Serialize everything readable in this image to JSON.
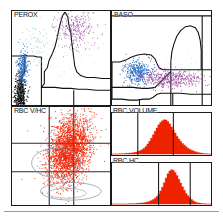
{
  "report": {
    "kind": "hematology-analyzer-cytogram-report",
    "panels": [
      "PEROX",
      "BASO",
      "RBC V/HC",
      "RBC VOLUME",
      "RBC HC"
    ]
  },
  "panels": {
    "perox": {
      "label": "PEROX",
      "type": "scatter",
      "xlabel": "",
      "ylabel": "",
      "populations": [
        {
          "name": "noise-debris",
          "color": "#111111",
          "n": 420
        },
        {
          "name": "lymphocytes",
          "color": "#2a6fc4",
          "n": 260
        },
        {
          "name": "mononuclear",
          "color": "#7fbf9f",
          "n": 70
        },
        {
          "name": "neutrophils-eosinophils",
          "color": "#8e3f96",
          "n": 300
        }
      ],
      "gate_color": "#101010"
    },
    "baso": {
      "label": "BASO",
      "type": "scatter",
      "populations": [
        {
          "name": "mononuclear",
          "color": "#2a6fc4",
          "n": 330
        },
        {
          "name": "polymorphonuclear",
          "color": "#8e3f96",
          "n": 420
        }
      ],
      "gate_color": "#101010"
    },
    "rbc_vhc": {
      "label": "RBC V/HC",
      "type": "scatter",
      "grid": {
        "vertical": 2,
        "horizontal": 2
      },
      "populations": [
        {
          "name": "red-blood-cells",
          "color": "#ef2200",
          "n": 2600
        }
      ],
      "contour_color": "#8c96a8"
    },
    "rbc_volume": {
      "label": "RBC VOLUME",
      "type": "histogram",
      "fill_color": "#ef2200",
      "markers": [
        0.26,
        0.62
      ],
      "bins": [
        0.0,
        0.0,
        0.0,
        0.0,
        0.01,
        0.01,
        0.01,
        0.02,
        0.02,
        0.03,
        0.03,
        0.04,
        0.05,
        0.06,
        0.08,
        0.1,
        0.13,
        0.17,
        0.22,
        0.29,
        0.37,
        0.46,
        0.56,
        0.66,
        0.76,
        0.85,
        0.92,
        0.97,
        1.0,
        0.99,
        0.95,
        0.88,
        0.79,
        0.7,
        0.61,
        0.52,
        0.44,
        0.37,
        0.31,
        0.26,
        0.21,
        0.17,
        0.14,
        0.11,
        0.09,
        0.07,
        0.05,
        0.04,
        0.03,
        0.02,
        0.01,
        0.01,
        0.0,
        0.0
      ]
    },
    "rbc_hc": {
      "label": "RBC HC",
      "type": "histogram",
      "fill_color": "#ef2200",
      "markers": [
        0.47,
        0.79
      ],
      "bins": [
        0.0,
        0.0,
        0.0,
        0.0,
        0.0,
        0.0,
        0.0,
        0.0,
        0.0,
        0.01,
        0.01,
        0.01,
        0.01,
        0.02,
        0.02,
        0.03,
        0.03,
        0.04,
        0.05,
        0.06,
        0.08,
        0.1,
        0.13,
        0.17,
        0.22,
        0.29,
        0.38,
        0.49,
        0.62,
        0.76,
        0.88,
        0.96,
        1.0,
        0.98,
        0.92,
        0.83,
        0.72,
        0.61,
        0.5,
        0.4,
        0.31,
        0.24,
        0.18,
        0.13,
        0.09,
        0.06,
        0.04,
        0.03,
        0.02,
        0.01,
        0.01,
        0.0,
        0.0,
        0.0
      ]
    }
  },
  "chart_data": [
    {
      "type": "scatter",
      "title": "PEROX",
      "xlabel": "Peroxidase Absorbance",
      "ylabel": "Light Scatter (Volume)",
      "series": [
        {
          "name": "Noise / Debris",
          "color": "#111111",
          "centroid": [
            0.07,
            0.1
          ],
          "spread": [
            0.035,
            0.11
          ],
          "n": 420
        },
        {
          "name": "Lymphocytes",
          "color": "#2a6fc4",
          "centroid": [
            0.1,
            0.4
          ],
          "spread": [
            0.03,
            0.085
          ],
          "n": 260
        },
        {
          "name": "LUC / Mono",
          "color": "#7fbf9f",
          "centroid": [
            0.25,
            0.62
          ],
          "spread": [
            0.075,
            0.13
          ],
          "n": 70
        },
        {
          "name": "Neutrophils / Eosinophils",
          "color": "#8e3f96",
          "centroid": [
            0.63,
            0.8
          ],
          "spread": [
            0.11,
            0.1
          ],
          "n": 300
        }
      ],
      "xlim": [
        0,
        1
      ],
      "ylim": [
        0,
        1
      ],
      "grid": false,
      "legend": "none"
    },
    {
      "type": "scatter",
      "title": "BASO",
      "xlabel": "Light Scatter (Low Angle)",
      "ylabel": "Light Scatter (High Angle)",
      "series": [
        {
          "name": "Mononuclear",
          "color": "#2a6fc4",
          "centroid": [
            0.26,
            0.35
          ],
          "spread": [
            0.075,
            0.07
          ],
          "n": 330
        },
        {
          "name": "Polymorphonuclear",
          "color": "#8e3f96",
          "centroid": [
            0.58,
            0.28
          ],
          "spread": [
            0.17,
            0.055
          ],
          "n": 420
        }
      ],
      "xlim": [
        0,
        1
      ],
      "ylim": [
        0,
        1
      ],
      "grid": false,
      "legend": "none"
    },
    {
      "type": "scatter",
      "title": "RBC V/HC",
      "xlabel": "Hemoglobin Concentration (HC)",
      "ylabel": "Volume (V)",
      "series": [
        {
          "name": "RBC",
          "color": "#ef2200",
          "centroid": [
            0.58,
            0.58
          ],
          "spread": [
            0.13,
            0.19
          ],
          "n": 2600
        }
      ],
      "xlim": [
        0,
        1
      ],
      "ylim": [
        0,
        1
      ],
      "grid": true,
      "legend": "none"
    },
    {
      "type": "area",
      "title": "RBC VOLUME",
      "xlabel": "Volume (fL)",
      "ylabel": "Relative Frequency",
      "x": [
        0,
        1,
        2,
        3,
        4,
        5,
        6,
        7,
        8,
        9,
        10,
        11,
        12,
        13,
        14,
        15,
        16,
        17,
        18,
        19,
        20,
        21,
        22,
        23,
        24,
        25,
        26,
        27,
        28,
        29,
        30,
        31,
        32,
        33,
        34,
        35,
        36,
        37,
        38,
        39,
        40,
        41,
        42,
        43,
        44,
        45,
        46,
        47,
        48,
        49,
        50,
        51,
        52,
        53
      ],
      "values": [
        0.0,
        0.0,
        0.0,
        0.0,
        0.01,
        0.01,
        0.01,
        0.02,
        0.02,
        0.03,
        0.03,
        0.04,
        0.05,
        0.06,
        0.08,
        0.1,
        0.13,
        0.17,
        0.22,
        0.29,
        0.37,
        0.46,
        0.56,
        0.66,
        0.76,
        0.85,
        0.92,
        0.97,
        1.0,
        0.99,
        0.95,
        0.88,
        0.79,
        0.7,
        0.61,
        0.52,
        0.44,
        0.37,
        0.31,
        0.26,
        0.21,
        0.17,
        0.14,
        0.11,
        0.09,
        0.07,
        0.05,
        0.04,
        0.03,
        0.02,
        0.01,
        0.01,
        0.0,
        0.0
      ],
      "markers": [
        0.26,
        0.62
      ],
      "ylim": [
        0,
        1
      ],
      "grid": false,
      "legend": "none"
    },
    {
      "type": "area",
      "title": "RBC HC",
      "xlabel": "Hemoglobin Concentration (g/dL)",
      "ylabel": "Relative Frequency",
      "x": [
        0,
        1,
        2,
        3,
        4,
        5,
        6,
        7,
        8,
        9,
        10,
        11,
        12,
        13,
        14,
        15,
        16,
        17,
        18,
        19,
        20,
        21,
        22,
        23,
        24,
        25,
        26,
        27,
        28,
        29,
        30,
        31,
        32,
        33,
        34,
        35,
        36,
        37,
        38,
        39,
        40,
        41,
        42,
        43,
        44,
        45,
        46,
        47,
        48,
        49,
        50,
        51,
        52,
        53
      ],
      "values": [
        0.0,
        0.0,
        0.0,
        0.0,
        0.0,
        0.0,
        0.0,
        0.0,
        0.0,
        0.01,
        0.01,
        0.01,
        0.01,
        0.02,
        0.02,
        0.03,
        0.03,
        0.04,
        0.05,
        0.06,
        0.08,
        0.1,
        0.13,
        0.17,
        0.22,
        0.29,
        0.38,
        0.49,
        0.62,
        0.76,
        0.88,
        0.96,
        1.0,
        0.98,
        0.92,
        0.83,
        0.72,
        0.61,
        0.5,
        0.4,
        0.31,
        0.24,
        0.18,
        0.13,
        0.09,
        0.06,
        0.04,
        0.03,
        0.02,
        0.01,
        0.01,
        0.0,
        0.0,
        0.0
      ],
      "markers": [
        0.47,
        0.79
      ],
      "ylim": [
        0,
        1
      ],
      "grid": false,
      "legend": "none"
    }
  ]
}
